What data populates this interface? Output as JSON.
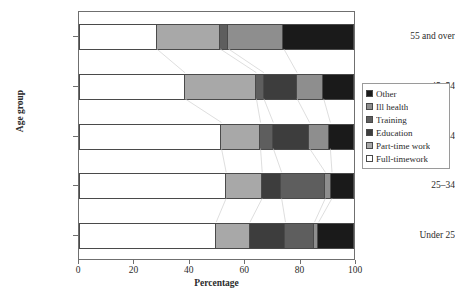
{
  "figure": {
    "title_remnant": "",
    "xaxis": {
      "label": "Percentage",
      "ticks": [
        "0",
        "20",
        "40",
        "60",
        "80",
        "100"
      ],
      "min": 0,
      "max": 100
    },
    "yaxis": {
      "label": "Age group",
      "ticks": [
        "55 and over",
        "45–54",
        "35–44",
        "25–34",
        "Under 25"
      ]
    },
    "legend": {
      "items": [
        {
          "label": "Other",
          "color": "#1a1a1a"
        },
        {
          "label": "Ill health",
          "color": "#8e8e8e"
        },
        {
          "label": "Training",
          "color": "#5e5e5e"
        },
        {
          "label": "Education",
          "color": "#3d3d3d"
        },
        {
          "label": "Part-time work",
          "color": "#a8a8a8"
        },
        {
          "label": "Full-timework",
          "color": "#ffffff"
        }
      ]
    }
  },
  "chart_data": {
    "type": "bar",
    "orientation": "horizontal",
    "stacked": true,
    "normalized": true,
    "title": "",
    "xlabel": "Percentage",
    "ylabel": "Age group",
    "xlim": [
      0,
      100
    ],
    "grid": false,
    "legend_position": "right",
    "categories": [
      "55 and over",
      "45–54",
      "35–44",
      "25–34",
      "Under 25"
    ],
    "series": [
      {
        "name": "Full-timework",
        "color": "#ffffff",
        "values": [
          28.4,
          38.6,
          51.8,
          53.5,
          49.9
        ]
      },
      {
        "name": "Part-time work",
        "color": "#a8a8a8",
        "values": [
          22.9,
          25.8,
          14.1,
          13.0,
          12.2
        ]
      },
      {
        "name": "Education",
        "color": "#3d3d3d",
        "values": [
          0.0,
          12.0,
          13.1,
          7.0,
          12.8
        ]
      },
      {
        "name": "Training",
        "color": "#5e5e5e",
        "values": [
          3.0,
          2.7,
          4.6,
          15.8,
          10.5
        ]
      },
      {
        "name": "Ill health",
        "color": "#8e8e8e",
        "values": [
          20.0,
          9.6,
          7.5,
          2.4,
          1.5
        ]
      },
      {
        "name": "Other",
        "color": "#1a1a1a",
        "values": [
          25.7,
          11.3,
          8.9,
          8.3,
          13.1
        ]
      }
    ],
    "bars": [
      {
        "category": "55 and over",
        "segments": [
          {
            "name": "Full-timework",
            "value": 28.4,
            "start": 0.0,
            "end": 28.4,
            "color": "#ffffff"
          },
          {
            "name": "Part-time work",
            "value": 22.9,
            "start": 28.4,
            "end": 51.3,
            "color": "#a8a8a8"
          },
          {
            "name": "Training",
            "value": 3.0,
            "start": 51.3,
            "end": 54.3,
            "color": "#5e5e5e"
          },
          {
            "name": "Ill health",
            "value": 20.0,
            "start": 54.3,
            "end": 74.3,
            "color": "#8e8e8e"
          },
          {
            "name": "Other",
            "value": 25.7,
            "start": 74.3,
            "end": 100.0,
            "color": "#1a1a1a"
          }
        ]
      },
      {
        "category": "45–54",
        "segments": [
          {
            "name": "Full-timework",
            "value": 38.6,
            "start": 0.0,
            "end": 38.6,
            "color": "#ffffff"
          },
          {
            "name": "Part-time work",
            "value": 25.8,
            "start": 38.6,
            "end": 64.4,
            "color": "#a8a8a8"
          },
          {
            "name": "Training",
            "value": 2.7,
            "start": 64.4,
            "end": 67.1,
            "color": "#5e5e5e"
          },
          {
            "name": "Education",
            "value": 12.0,
            "start": 67.1,
            "end": 79.1,
            "color": "#3d3d3d"
          },
          {
            "name": "Ill health",
            "value": 9.6,
            "start": 79.1,
            "end": 88.7,
            "color": "#8e8e8e"
          },
          {
            "name": "Other",
            "value": 11.3,
            "start": 88.7,
            "end": 100.0,
            "color": "#1a1a1a"
          }
        ]
      },
      {
        "category": "35–44",
        "segments": [
          {
            "name": "Full-timework",
            "value": 51.8,
            "start": 0.0,
            "end": 51.8,
            "color": "#ffffff"
          },
          {
            "name": "Part-time work",
            "value": 14.1,
            "start": 51.8,
            "end": 65.9,
            "color": "#a8a8a8"
          },
          {
            "name": "Training",
            "value": 4.6,
            "start": 65.9,
            "end": 70.5,
            "color": "#5e5e5e"
          },
          {
            "name": "Education",
            "value": 13.1,
            "start": 70.5,
            "end": 83.6,
            "color": "#3d3d3d"
          },
          {
            "name": "Ill health",
            "value": 7.5,
            "start": 83.6,
            "end": 91.1,
            "color": "#8e8e8e"
          },
          {
            "name": "Other",
            "value": 8.9,
            "start": 91.1,
            "end": 100.0,
            "color": "#1a1a1a"
          }
        ]
      },
      {
        "category": "25–34",
        "segments": [
          {
            "name": "Full-timework",
            "value": 53.5,
            "start": 0.0,
            "end": 53.5,
            "color": "#ffffff"
          },
          {
            "name": "Part-time work",
            "value": 13.0,
            "start": 53.5,
            "end": 66.5,
            "color": "#a8a8a8"
          },
          {
            "name": "Education",
            "value": 7.0,
            "start": 66.5,
            "end": 73.5,
            "color": "#3d3d3d"
          },
          {
            "name": "Training",
            "value": 15.8,
            "start": 73.5,
            "end": 89.3,
            "color": "#5e5e5e"
          },
          {
            "name": "Ill health",
            "value": 2.4,
            "start": 89.3,
            "end": 91.7,
            "color": "#8e8e8e"
          },
          {
            "name": "Other",
            "value": 8.3,
            "start": 91.7,
            "end": 100.0,
            "color": "#1a1a1a"
          }
        ]
      },
      {
        "category": "Under 25",
        "segments": [
          {
            "name": "Full-timework",
            "value": 49.9,
            "start": 0.0,
            "end": 49.9,
            "color": "#ffffff"
          },
          {
            "name": "Part-time work",
            "value": 12.2,
            "start": 49.9,
            "end": 62.1,
            "color": "#a8a8a8"
          },
          {
            "name": "Education",
            "value": 12.8,
            "start": 62.1,
            "end": 74.9,
            "color": "#3d3d3d"
          },
          {
            "name": "Training",
            "value": 10.5,
            "start": 74.9,
            "end": 85.4,
            "color": "#5e5e5e"
          },
          {
            "name": "Ill health",
            "value": 1.5,
            "start": 85.4,
            "end": 86.9,
            "color": "#8e8e8e"
          },
          {
            "name": "Other",
            "value": 13.1,
            "start": 86.9,
            "end": 100.0,
            "color": "#1a1a1a"
          }
        ]
      }
    ]
  }
}
